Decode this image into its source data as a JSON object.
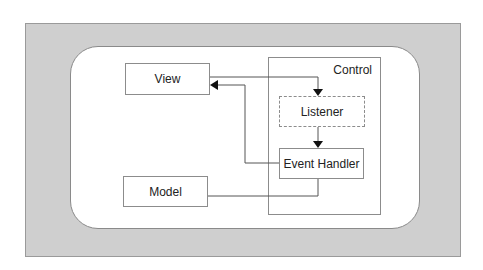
{
  "diagram": {
    "type": "mvc-architecture",
    "nodes": {
      "view": {
        "label": "View"
      },
      "model": {
        "label": "Model"
      },
      "control": {
        "label": "Control"
      },
      "listener": {
        "label": "Listener",
        "style": "dashed"
      },
      "event_handler": {
        "label": "Event Handler"
      }
    },
    "edges": [
      {
        "from": "view",
        "to": "listener",
        "arrow": "to"
      },
      {
        "from": "listener",
        "to": "event_handler",
        "arrow": "to"
      },
      {
        "from": "event_handler",
        "to": "view",
        "arrow": "to"
      },
      {
        "from": "event_handler",
        "to": "model",
        "arrow": "none"
      }
    ],
    "colors": {
      "frame": "#cfcfcf",
      "border": "#8c8c8c",
      "background": "#ffffff"
    }
  }
}
